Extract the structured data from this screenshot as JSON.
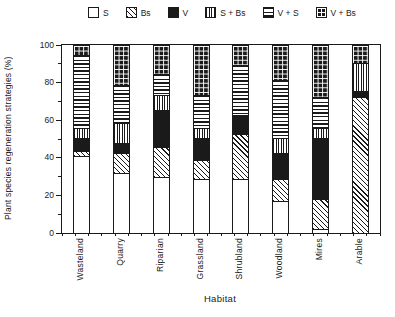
{
  "chart_data": {
    "type": "bar",
    "stacked": true,
    "title": "",
    "xlabel": "Habitat",
    "ylabel": "Plant species regeneration strategies (%)",
    "ylim": [
      0,
      100
    ],
    "yticks": [
      0,
      20,
      40,
      60,
      80,
      100
    ],
    "y_minor_ticks": [
      10,
      30,
      50,
      70,
      90
    ],
    "grid": false,
    "legend_position": "top",
    "categories": [
      "Wasteland",
      "Quarry",
      "Riparian",
      "Grassland",
      "Shrubland",
      "Woodland",
      "Mires",
      "Arable"
    ],
    "series": [
      {
        "name": "S",
        "pattern": "plain-white",
        "values": [
          41,
          32,
          30,
          29,
          29,
          17,
          2,
          0
        ]
      },
      {
        "name": "Bs",
        "pattern": "diagonal-hatch",
        "values": [
          3,
          11,
          16,
          10,
          24,
          12,
          16,
          73
        ]
      },
      {
        "name": "V",
        "pattern": "solid-black",
        "values": [
          7,
          5,
          20,
          12,
          10,
          14,
          33,
          3
        ]
      },
      {
        "name": "S + Bs",
        "pattern": "vertical-stripes",
        "values": [
          5,
          11,
          8,
          5,
          0,
          8,
          5,
          15
        ]
      },
      {
        "name": "V + S",
        "pattern": "horizontal-stripes",
        "values": [
          39,
          20,
          11,
          18,
          27,
          31,
          17,
          0
        ]
      },
      {
        "name": "V + Bs",
        "pattern": "checker-grid",
        "values": [
          5,
          21,
          15,
          26,
          10,
          18,
          27,
          9
        ]
      }
    ],
    "colors": {
      "foreground": "#1a1a1a",
      "background": "#ffffff"
    }
  }
}
